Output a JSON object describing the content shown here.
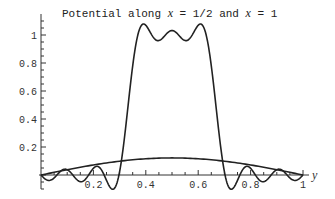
{
  "chart_data": {
    "type": "line",
    "title": "Potential along x = 1/2 and x = 1",
    "title_parts": [
      "Potential along ",
      "x",
      " = 1/2 and ",
      "x",
      " = 1"
    ],
    "xlabel": "y",
    "ylabel": "",
    "xlim": [
      0,
      1
    ],
    "ylim": [
      -0.1,
      1.15
    ],
    "x_ticks": [
      "0.2",
      "0.4",
      "0.6",
      "0.8",
      "1"
    ],
    "y_ticks": [
      "0.2",
      "0.4",
      "0.6",
      "0.8",
      "1"
    ],
    "grid": false,
    "legend": null,
    "series": [
      {
        "name": "x = 1/2",
        "description": "Fourier series approximation of a square pulse (value ~1 on 1/3<y<2/3, ~0 elsewhere) with Gibbs ringing",
        "x": [
          0,
          0.05,
          0.1,
          0.15,
          0.2,
          0.25,
          0.28,
          0.3,
          0.32,
          0.34,
          0.36,
          0.4,
          0.44,
          0.48,
          0.5,
          0.52,
          0.56,
          0.6,
          0.64,
          0.66,
          0.68,
          0.7,
          0.72,
          0.75,
          0.8,
          0.85,
          0.9,
          0.95,
          1
        ],
        "values": [
          0,
          -0.01,
          0.01,
          -0.02,
          0.02,
          -0.03,
          0.05,
          -0.08,
          0.5,
          1.07,
          1.05,
          0.93,
          1.02,
          0.94,
          0.95,
          0.94,
          1.02,
          0.93,
          1.05,
          1.07,
          0.5,
          -0.08,
          0.05,
          -0.03,
          0.02,
          -0.02,
          0.01,
          -0.01,
          0
        ]
      },
      {
        "name": "x = 1",
        "description": "Smooth low hump peaking at y = 0.5",
        "x": [
          0,
          0.1,
          0.2,
          0.3,
          0.4,
          0.5,
          0.6,
          0.7,
          0.8,
          0.9,
          1
        ],
        "values": [
          0,
          0.035,
          0.07,
          0.1,
          0.117,
          0.122,
          0.117,
          0.1,
          0.07,
          0.035,
          0
        ]
      }
    ]
  }
}
